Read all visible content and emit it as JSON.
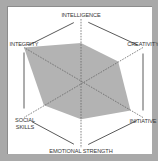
{
  "chart_data": {
    "type": "radar",
    "title": "",
    "categories": [
      "INTELLIGENCE",
      "CREATIVITY",
      "INITIATIVE",
      "EMOTIONAL STRENGTH",
      "SOCIAL SKILLS",
      "INTEGRITY"
    ],
    "series": [
      {
        "name": "Profile",
        "values": [
          6.2,
          6.0,
          8.0,
          5.6,
          6.5,
          10.0
        ]
      }
    ],
    "ylim": [
      0,
      10
    ],
    "grid": "hexagon outline with dashed spokes",
    "legend": "none"
  },
  "labels": {
    "intelligence": "INTELLIGENCE",
    "creativity": "CREATIVITY",
    "initiative": "INITIATIVE",
    "emotional_strength": "EMOTIONAL STRENGTH",
    "social_skills_line1": "SOCIAL",
    "social_skills_line2": "SKILLS",
    "integrity": "INTEGRITY"
  },
  "colors": {
    "frame": "#a9a9a9",
    "panel": "#ffffff",
    "fill": "#b3b3b3",
    "lines": "#555555"
  }
}
